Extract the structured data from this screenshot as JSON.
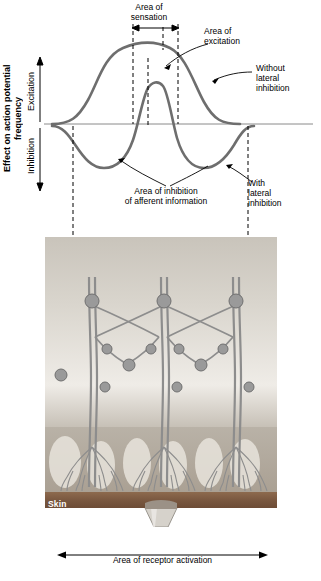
{
  "figure": {
    "axis_title": "Effect on action\npotential frequency",
    "axis_upper_label": "Excitation",
    "axis_lower_label": "Inhibition",
    "labels": {
      "area_of_sensation": "Area of\nsensation",
      "area_of_excitation": "Area of\nexcitation",
      "without_lateral_inhibition": "Without\nlateral\ninhibition",
      "with_lateral_inhibition": "With\nlateral\ninhibition",
      "area_of_inhibition": "Area of inhibition\nof afferent information",
      "skin": "Skin",
      "area_of_receptor_activation": "Area of receptor activation"
    },
    "colors": {
      "curve": "#6e6e6e",
      "dashed": "#000000",
      "baseline": "#808080",
      "skin_band": "#8a6a52",
      "epidermis": "#d8d0c6",
      "dermis": "#b9b2a8",
      "background_panel": "#cfcac2"
    }
  }
}
